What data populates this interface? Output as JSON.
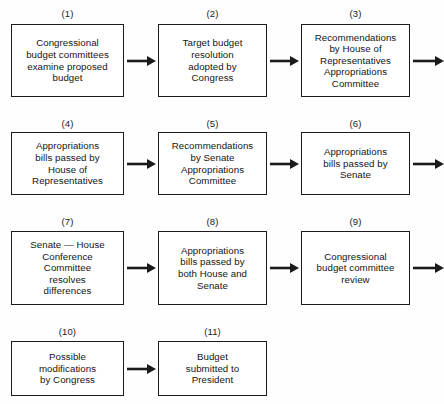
{
  "diagram": {
    "background_color": "#fefefe",
    "line_color": "#1b1b1b",
    "text_color": "#141414",
    "nodes": [
      {
        "id": 1,
        "label": "(1)",
        "text": "Congressional\nbudget committees\nexamine proposed\nbudget",
        "x": 11,
        "y": 24,
        "w": 113,
        "h": 73,
        "label_x": 11,
        "label_y": 8,
        "label_w": 113
      },
      {
        "id": 2,
        "label": "(2)",
        "text": "Target budget\nresolution\nadopted by\nCongress",
        "x": 158,
        "y": 24,
        "w": 109,
        "h": 73,
        "label_x": 158,
        "label_y": 8,
        "label_w": 109
      },
      {
        "id": 3,
        "label": "(3)",
        "text": "Recommendations\nby House of\nRepresentatives\nAppropriations\nCommittee",
        "x": 301,
        "y": 24,
        "w": 109,
        "h": 73,
        "label_x": 301,
        "label_y": 8,
        "label_w": 109
      },
      {
        "id": 4,
        "label": "(4)",
        "text": "Appropriations\nbills passed by\nHouse of\nRepresentatives",
        "x": 11,
        "y": 132,
        "w": 113,
        "h": 63,
        "label_x": 11,
        "label_y": 118,
        "label_w": 113
      },
      {
        "id": 5,
        "label": "(5)",
        "text": "Recommendations\nby Senate\nAppropriations\nCommittee",
        "x": 158,
        "y": 132,
        "w": 109,
        "h": 63,
        "label_x": 158,
        "label_y": 118,
        "label_w": 109
      },
      {
        "id": 6,
        "label": "(6)",
        "text": "Appropriations\nbills passed by\nSenate",
        "x": 301,
        "y": 132,
        "w": 109,
        "h": 63,
        "label_x": 301,
        "label_y": 118,
        "label_w": 109
      },
      {
        "id": 7,
        "label": "(7)",
        "text": "Senate — House\nConference\nCommittee\nresolves\ndifferences",
        "x": 11,
        "y": 231,
        "w": 113,
        "h": 74,
        "label_x": 11,
        "label_y": 216,
        "label_w": 113
      },
      {
        "id": 8,
        "label": "(8)",
        "text": "Appropriations\nbills passed by\nboth House and\nSenate",
        "x": 158,
        "y": 231,
        "w": 109,
        "h": 74,
        "label_x": 158,
        "label_y": 216,
        "label_w": 109
      },
      {
        "id": 9,
        "label": "(9)",
        "text": "Congressional\nbudget committee\nreview",
        "x": 301,
        "y": 231,
        "w": 109,
        "h": 74,
        "label_x": 301,
        "label_y": 216,
        "label_w": 109
      },
      {
        "id": 10,
        "label": "(10)",
        "text": "Possible\nmodifications\nby Congress",
        "x": 11,
        "y": 341,
        "w": 113,
        "h": 55,
        "label_x": 11,
        "label_y": 326,
        "label_w": 113
      },
      {
        "id": 11,
        "label": "(11)",
        "text": "Budget\nsubmitted to\nPresident",
        "x": 158,
        "y": 341,
        "w": 109,
        "h": 55,
        "label_x": 158,
        "label_y": 326,
        "label_w": 109
      }
    ],
    "arrows": [
      {
        "name": "arrow-1-to-2",
        "x": 127,
        "y": 54,
        "w": 29
      },
      {
        "name": "arrow-2-to-3",
        "x": 270,
        "y": 54,
        "w": 29
      },
      {
        "name": "arrow-3-to-4",
        "x": 413,
        "y": 54,
        "w": 31
      },
      {
        "name": "arrow-4-to-5",
        "x": 127,
        "y": 157,
        "w": 29
      },
      {
        "name": "arrow-5-to-6",
        "x": 270,
        "y": 157,
        "w": 29
      },
      {
        "name": "arrow-6-to-7",
        "x": 413,
        "y": 157,
        "w": 31
      },
      {
        "name": "arrow-7-to-8",
        "x": 127,
        "y": 261,
        "w": 29
      },
      {
        "name": "arrow-8-to-9",
        "x": 270,
        "y": 261,
        "w": 29
      },
      {
        "name": "arrow-9-to-10",
        "x": 413,
        "y": 261,
        "w": 31
      },
      {
        "name": "arrow-10-to-11",
        "x": 127,
        "y": 362,
        "w": 29
      }
    ]
  }
}
